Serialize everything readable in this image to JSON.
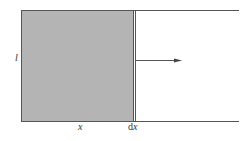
{
  "diagram": {
    "labels": {
      "height": "l",
      "width": "x",
      "increment_d": "d",
      "increment_x": "x"
    },
    "colors": {
      "fill": "#b4b4b4",
      "stroke": "#555555",
      "background": "#ffffff"
    },
    "elements": {
      "shaded_region": "rectangle",
      "movable_bar": "vertical line",
      "rails": "two horizontal lines",
      "arrow": "force/motion arrow pointing right"
    }
  }
}
